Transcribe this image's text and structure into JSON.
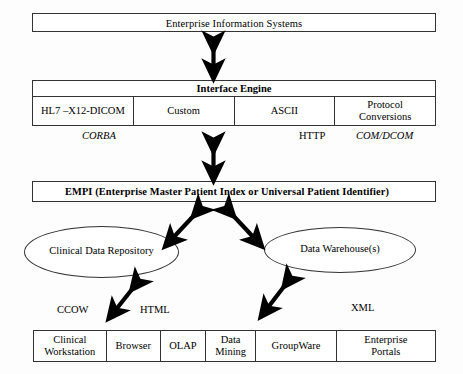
{
  "diagram": {
    "top_layer": {
      "label": "Enterprise Information Systems"
    },
    "interface_engine": {
      "title": "Interface Engine",
      "columns": [
        "HL7 –X12-DICOM",
        "Custom",
        "ASCII",
        "Protocol Conversions"
      ],
      "protocol_cells": {
        "c1_line1": "HL7 –X12-DICOM",
        "c2_line1": "Custom",
        "c3_line1": "ASCII",
        "c4_line1": "Protocol",
        "c4_line2": "Conversions"
      }
    },
    "middle_protocols": [
      {
        "name": "CORBA",
        "style": "italic"
      },
      {
        "name": "HTTP",
        "style": "normal"
      },
      {
        "name": "COM/DCOM",
        "style": "italic"
      }
    ],
    "empi": {
      "label": "EMPI (Enterprise Master Patient Index or Universal Patient Identifier)"
    },
    "stores": [
      {
        "label": "Clinical Data Repository",
        "shape": "ellipse"
      },
      {
        "label": "Data Warehouse(s)",
        "shape": "ellipse"
      }
    ],
    "lower_protocols": [
      {
        "name": "CCOW",
        "style": "normal"
      },
      {
        "name": "HTML",
        "style": "normal"
      },
      {
        "name": "XML",
        "style": "normal"
      }
    ],
    "applications": {
      "cells": [
        {
          "line1": "Clinical",
          "line2": "Workstation"
        },
        {
          "line1": "Browser",
          "line2": ""
        },
        {
          "line1": "OLAP",
          "line2": ""
        },
        {
          "line1": "Data",
          "line2": "Mining"
        },
        {
          "line1": "GroupWare",
          "line2": ""
        },
        {
          "line1": "Enterprise",
          "line2": "Portals"
        }
      ]
    },
    "connectors": [
      {
        "name": "eis-to-interface-engine",
        "type": "double-headed-vertical"
      },
      {
        "name": "interface-engine-to-empi",
        "type": "double-headed-vertical"
      },
      {
        "name": "empi-to-clinical-data-repository",
        "type": "double-headed-diagonal"
      },
      {
        "name": "empi-to-data-warehouse",
        "type": "double-headed-diagonal"
      },
      {
        "name": "clinical-data-repository-to-applications",
        "type": "double-headed-diagonal"
      },
      {
        "name": "data-warehouse-to-applications",
        "type": "double-headed-diagonal"
      }
    ],
    "colors": {
      "stroke": "#333333",
      "background": "#fdfdfd",
      "text": "#000000",
      "arrow": "#000000"
    }
  }
}
